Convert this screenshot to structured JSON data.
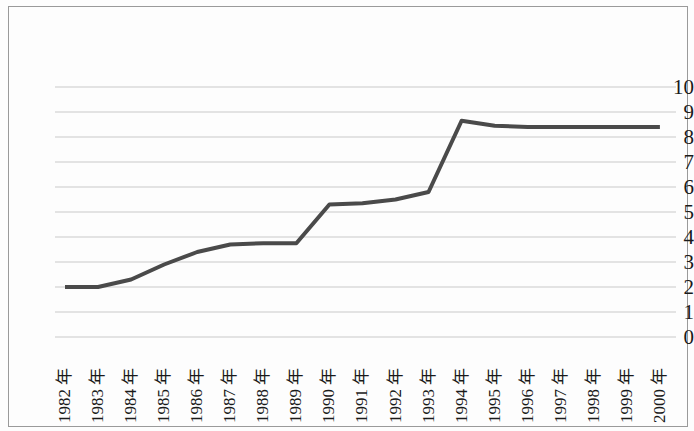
{
  "chart_data": {
    "type": "line",
    "title": "",
    "subtitle": "",
    "xlabel": "",
    "ylabel": "",
    "categories": [
      "1982 年",
      "1983 年",
      "1984 年",
      "1985 年",
      "1986 年",
      "1987 年",
      "1988 年",
      "1989 年",
      "1990 年",
      "1991 年",
      "1992 年",
      "1993 年",
      "1994 年",
      "1995 年",
      "1996 年",
      "1997 年",
      "1998 年",
      "1999 年",
      "2000 年"
    ],
    "values": [
      2.0,
      2.0,
      2.3,
      2.9,
      3.4,
      3.7,
      3.75,
      3.75,
      5.3,
      5.35,
      5.5,
      5.8,
      8.65,
      8.45,
      8.4,
      8.4,
      8.4,
      8.4,
      8.4
    ],
    "series": [
      {
        "name": "series-1",
        "values": [
          2.0,
          2.0,
          2.3,
          2.9,
          3.4,
          3.7,
          3.75,
          3.75,
          5.3,
          5.35,
          5.5,
          5.8,
          8.65,
          8.45,
          8.4,
          8.4,
          8.4,
          8.4,
          8.4
        ],
        "color": "#4a4a4a"
      }
    ],
    "ylim": [
      0,
      10
    ],
    "yticks": [
      0,
      1,
      2,
      3,
      4,
      5,
      6,
      7,
      8,
      9,
      10
    ],
    "ytick_labels": [
      "0",
      "1",
      "2",
      "3",
      "4",
      "5",
      "6",
      "7",
      "8",
      "9",
      "10"
    ],
    "grid": true,
    "grid_axis": "y",
    "grid_color": "#c9c9c9",
    "legend": false,
    "legend_position": "none",
    "line_color": "#4a4a4a",
    "line_width": 4,
    "markers": false,
    "background_color": "#fdfdfd",
    "border_color": "#9a9a9a"
  },
  "axes": {
    "x_rotation_degrees": -90
  }
}
